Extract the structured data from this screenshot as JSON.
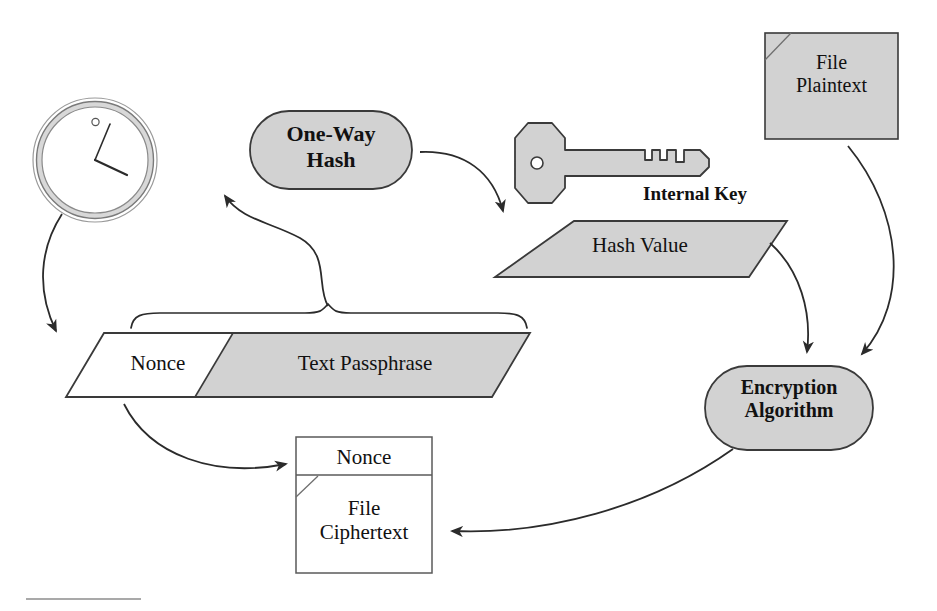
{
  "figure": {
    "background_color": "#ffffff",
    "stroke_color": "#333333",
    "fill_gray": "#d2d2d2",
    "fill_white": "#ffffff",
    "text_color": "#111111"
  },
  "nodes": {
    "clock": {
      "name": "clock-icon",
      "label": "",
      "shape": "clock",
      "fill": "#ffffff",
      "ring_fill": "#cfcfcf"
    },
    "one_way_hash": {
      "name": "one-way-hash",
      "label": "One-Way\nHash",
      "line1": "One-Way",
      "line2": "Hash",
      "shape": "rounded-oval",
      "fill": "#d2d2d2",
      "bold": true
    },
    "internal_key": {
      "name": "internal-key",
      "label": "Internal Key",
      "shape": "key-icon-with-caption",
      "fill": "#d2d2d2",
      "bold": true
    },
    "hash_value": {
      "name": "hash-value",
      "label": "Hash Value",
      "shape": "parallelogram",
      "fill": "#d2d2d2",
      "bold": false
    },
    "file_plaintext": {
      "name": "file-plaintext",
      "label": "File\nPlaintext",
      "line1": "File",
      "line2": "Plaintext",
      "shape": "document-folded-corner",
      "fill": "#d2d2d2"
    },
    "nonce_passphrase": {
      "name": "nonce-passphrase-parallelogram",
      "shape": "split-parallelogram",
      "left_label": "Nonce",
      "right_label": "Text Passphrase",
      "left_fill": "#ffffff",
      "right_fill": "#d2d2d2"
    },
    "encryption_algorithm": {
      "name": "encryption-algorithm",
      "label": "Encryption\nAlgorithm",
      "line1": "Encryption",
      "line2": "Algorithm",
      "shape": "rounded-oval",
      "fill": "#d2d2d2",
      "bold": true
    },
    "output_file": {
      "name": "output-file",
      "shape": "box-with-header",
      "header_label": "Nonce",
      "body_label": "File\nCiphertext",
      "body_line1": "File",
      "body_line2": "Ciphertext",
      "fill": "#ffffff"
    }
  },
  "connectors": [
    {
      "name": "clock-to-nonce-arrow",
      "from": "clock",
      "to": "nonce_passphrase",
      "style": "curved-arrow"
    },
    {
      "name": "passphrase-brace-to-hash-arrow",
      "from": "nonce_passphrase",
      "to": "one_way_hash",
      "style": "brace-curved-arrow"
    },
    {
      "name": "hash-to-hash-value-arrow",
      "from": "one_way_hash",
      "to": "hash_value",
      "style": "curved-arrow"
    },
    {
      "name": "hash-value-to-encryption-arrow",
      "from": "hash_value",
      "to": "encryption_algorithm",
      "style": "curved-arrow"
    },
    {
      "name": "plaintext-to-encryption-arrow",
      "from": "file_plaintext",
      "to": "encryption_algorithm",
      "style": "curved-arrow"
    },
    {
      "name": "encryption-to-output-arrow",
      "from": "encryption_algorithm",
      "to": "output_file",
      "style": "curved-arrow"
    },
    {
      "name": "nonce-to-output-arrow",
      "from": "nonce_passphrase",
      "to": "output_file",
      "style": "curved-arrow"
    }
  ],
  "footer": {
    "name": "footer-rule",
    "label": ""
  }
}
